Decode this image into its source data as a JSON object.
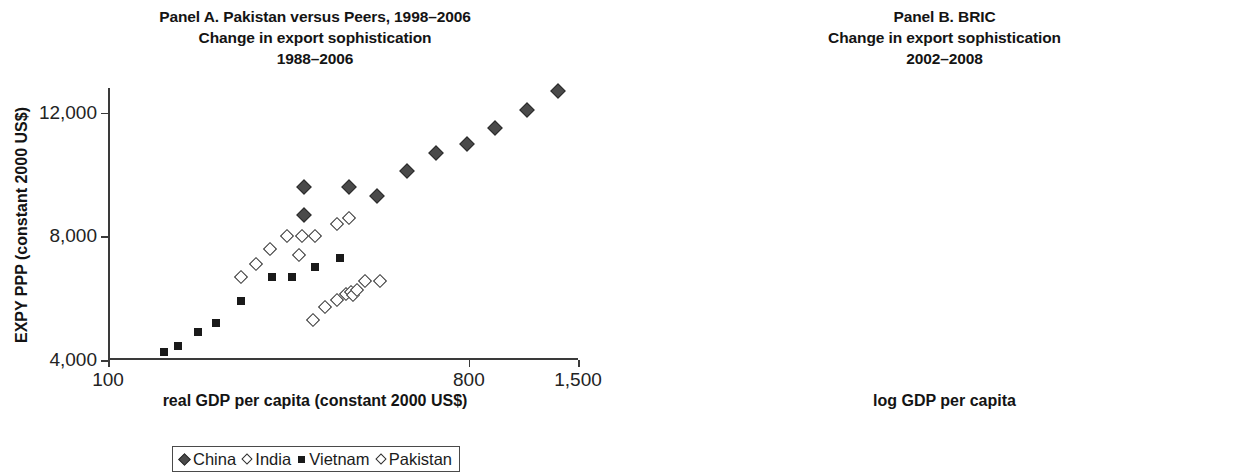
{
  "panel_a": {
    "title_lines": [
      "Panel A. Pakistan versus Peers, 1998–2006",
      "Change in export sophistication",
      "1988–2006"
    ],
    "xlabel": "real GDP per capita (constant 2000 US$)",
    "ylabel": "EXPY PPP (constant 2000 US$)",
    "xticks": [
      "100",
      "800",
      "1,500"
    ],
    "yticks": [
      "4,000",
      "8,000",
      "12,000"
    ],
    "legend": [
      {
        "label": "China",
        "marker": "diamond-filled"
      },
      {
        "label": "India",
        "marker": "diamond-open"
      },
      {
        "label": "Vietnam",
        "marker": "square-filled"
      },
      {
        "label": "Pakistan",
        "marker": "diamond-open"
      }
    ]
  },
  "panel_b": {
    "title_lines": [
      "Panel B. BRIC",
      "Change in export sophistication",
      "2002–2008"
    ],
    "xlabel": "log GDP per capita",
    "ylabel": "log EXPY",
    "xticks": [
      "7.5",
      "8",
      "8.5",
      "9",
      "9.5"
    ],
    "yticks": [
      "9.3",
      "9.4",
      "9.5",
      "9.6"
    ],
    "legend": [
      {
        "label": "Russia",
        "marker": "square-gray"
      },
      {
        "label": "China",
        "marker": "square-open"
      },
      {
        "label": "Brazil",
        "marker": "square-filled"
      },
      {
        "label": "India",
        "marker": "square-open"
      }
    ]
  },
  "chart_data": [
    {
      "type": "scatter",
      "panel": "A",
      "title": "Panel A. Pakistan versus Peers, 1998–2006 / Change in export sophistication 1988–2006",
      "xlabel": "real GDP per capita (constant 2000 US$)",
      "ylabel": "EXPY PPP (constant 2000 US$)",
      "xscale": "log",
      "xlim": [
        100,
        1500
      ],
      "ylim": [
        4000,
        12800
      ],
      "xticks": [
        100,
        800,
        1500
      ],
      "yticks": [
        4000,
        8000,
        12000
      ],
      "grid": false,
      "legend_position": "below",
      "series": [
        {
          "name": "China",
          "marker": "diamond-filled",
          "points": [
            {
              "x": 310,
              "y": 9600
            },
            {
              "x": 310,
              "y": 8700
            },
            {
              "x": 400,
              "y": 9600
            },
            {
              "x": 470,
              "y": 9300
            },
            {
              "x": 560,
              "y": 10100
            },
            {
              "x": 660,
              "y": 10700
            },
            {
              "x": 790,
              "y": 11000
            },
            {
              "x": 930,
              "y": 11500
            },
            {
              "x": 1120,
              "y": 12100
            },
            {
              "x": 1340,
              "y": 12700
            }
          ]
        },
        {
          "name": "India",
          "marker": "diamond-open",
          "points": [
            {
              "x": 215,
              "y": 6700
            },
            {
              "x": 235,
              "y": 7100
            },
            {
              "x": 255,
              "y": 7600
            },
            {
              "x": 280,
              "y": 8000
            },
            {
              "x": 305,
              "y": 8000
            },
            {
              "x": 330,
              "y": 8000
            },
            {
              "x": 375,
              "y": 8400
            },
            {
              "x": 400,
              "y": 8600
            },
            {
              "x": 300,
              "y": 7400
            }
          ]
        },
        {
          "name": "Vietnam",
          "marker": "square-filled",
          "points": [
            {
              "x": 138,
              "y": 4250
            },
            {
              "x": 150,
              "y": 4450
            },
            {
              "x": 168,
              "y": 4900
            },
            {
              "x": 186,
              "y": 5200
            },
            {
              "x": 215,
              "y": 5900
            },
            {
              "x": 258,
              "y": 6700
            },
            {
              "x": 288,
              "y": 6700
            },
            {
              "x": 330,
              "y": 7000
            },
            {
              "x": 380,
              "y": 7300
            }
          ]
        },
        {
          "name": "Pakistan",
          "marker": "diamond-open",
          "points": [
            {
              "x": 325,
              "y": 5300
            },
            {
              "x": 350,
              "y": 5700
            },
            {
              "x": 375,
              "y": 5950
            },
            {
              "x": 395,
              "y": 6150
            },
            {
              "x": 405,
              "y": 6200
            },
            {
              "x": 410,
              "y": 6100
            },
            {
              "x": 420,
              "y": 6250
            },
            {
              "x": 440,
              "y": 6550
            },
            {
              "x": 480,
              "y": 6550
            }
          ]
        }
      ]
    },
    {
      "type": "scatter",
      "panel": "B",
      "title": "Panel B. BRIC / Change in export sophistication 2002–2008",
      "xlabel": "log GDP per capita",
      "ylabel": "log EXPY",
      "xlim": [
        7.42,
        9.65
      ],
      "ylim": [
        9.27,
        9.64
      ],
      "xticks": [
        7.5,
        8,
        8.5,
        9,
        9.5
      ],
      "yticks": [
        9.3,
        9.4,
        9.5,
        9.6
      ],
      "grid": false,
      "legend_position": "below",
      "point_labels": "two-digit year",
      "series": [
        {
          "name": "Russia",
          "marker": "square-gray",
          "points": [
            {
              "x": 9.22,
              "y": 9.585,
              "label": "02"
            },
            {
              "x": 9.28,
              "y": 9.572,
              "label": "03"
            },
            {
              "x": 9.36,
              "y": 9.545,
              "label": "04"
            },
            {
              "x": 9.4,
              "y": 9.528,
              "label": "05"
            },
            {
              "x": 9.42,
              "y": 9.548,
              "label": "06"
            },
            {
              "x": 9.47,
              "y": 9.545,
              "label": "07"
            },
            {
              "x": 9.56,
              "y": 9.492,
              "label": "08"
            }
          ]
        },
        {
          "name": "China",
          "marker": "square-open",
          "points": [
            {
              "x": 7.73,
              "y": 9.551,
              "label": "02"
            },
            {
              "x": 7.8,
              "y": 9.561,
              "label": "03"
            },
            {
              "x": 7.92,
              "y": 9.576,
              "label": "04"
            },
            {
              "x": 8.02,
              "y": 9.58,
              "label": "05"
            },
            {
              "x": 8.14,
              "y": 9.586,
              "label": "06"
            },
            {
              "x": 8.26,
              "y": 9.589,
              "label": "07"
            },
            {
              "x": 8.36,
              "y": 9.598,
              "label": "08"
            }
          ]
        },
        {
          "name": "Brazil",
          "marker": "square-filled",
          "points": [
            {
              "x": 9.03,
              "y": 9.378,
              "label": "02"
            },
            {
              "x": 8.99,
              "y": 9.384,
              "label": "03"
            },
            {
              "x": 9.06,
              "y": 9.39,
              "label": "04"
            },
            {
              "x": 9.07,
              "y": 9.412,
              "label": "05"
            },
            {
              "x": 9.1,
              "y": 9.418,
              "label": "06"
            },
            {
              "x": 9.12,
              "y": 9.4,
              "label": "07"
            },
            {
              "x": 9.15,
              "y": 9.372,
              "label": "08"
            }
          ]
        },
        {
          "name": "India",
          "marker": "square-open",
          "points": [
            {
              "x": 7.54,
              "y": 9.397,
              "label": "02"
            },
            {
              "x": 7.6,
              "y": 9.412,
              "label": "03"
            },
            {
              "x": 7.66,
              "y": 9.428,
              "label": "04"
            },
            {
              "x": 7.71,
              "y": 9.444,
              "label": "05"
            },
            {
              "x": 7.78,
              "y": 9.432,
              "label": "06"
            },
            {
              "x": 7.84,
              "y": 9.441,
              "label": "07"
            },
            {
              "x": 7.89,
              "y": 9.43,
              "label": "08"
            }
          ]
        }
      ]
    }
  ]
}
